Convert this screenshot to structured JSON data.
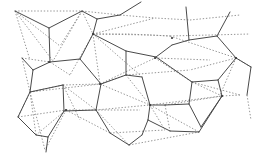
{
  "diagram": {
    "type": "voronoi-delaunay-overlay",
    "colors": {
      "background": "#ffffff",
      "voronoi": "#4a4a4a",
      "delaunay": "#8a8a8a",
      "site": "#3a3a3a"
    },
    "voronoi_edges": [
      [
        15,
        11,
        49,
        28
      ],
      [
        49,
        28,
        82,
        11
      ],
      [
        49,
        28,
        50,
        62
      ],
      [
        50,
        62,
        80,
        59
      ],
      [
        80,
        59,
        93,
        34
      ],
      [
        93,
        34,
        97,
        19
      ],
      [
        97,
        19,
        82,
        11
      ],
      [
        97,
        19,
        120,
        15
      ],
      [
        120,
        15,
        141,
        2
      ],
      [
        93,
        34,
        126,
        51
      ],
      [
        126,
        51,
        126,
        75
      ],
      [
        126,
        51,
        156,
        57
      ],
      [
        50,
        62,
        33,
        70
      ],
      [
        33,
        70,
        22,
        58
      ],
      [
        33,
        70,
        30,
        92
      ],
      [
        30,
        92,
        18,
        117
      ],
      [
        18,
        117,
        36,
        135
      ],
      [
        36,
        135,
        48,
        137
      ],
      [
        48,
        137,
        46,
        152
      ],
      [
        30,
        92,
        63,
        85
      ],
      [
        63,
        85,
        64,
        111
      ],
      [
        64,
        111,
        48,
        137
      ],
      [
        80,
        59,
        101,
        84
      ],
      [
        101,
        84,
        96,
        110
      ],
      [
        96,
        110,
        64,
        111
      ],
      [
        101,
        84,
        126,
        75
      ],
      [
        126,
        75,
        142,
        77
      ],
      [
        96,
        110,
        110,
        133
      ],
      [
        110,
        133,
        129,
        145
      ],
      [
        129,
        145,
        142,
        135
      ],
      [
        156,
        57,
        192,
        82
      ],
      [
        192,
        82,
        189,
        104
      ],
      [
        156,
        57,
        172,
        45
      ],
      [
        172,
        45,
        189,
        40
      ],
      [
        189,
        40,
        186,
        7
      ],
      [
        189,
        40,
        217,
        36
      ],
      [
        217,
        36,
        230,
        12
      ],
      [
        217,
        36,
        236,
        58
      ],
      [
        236,
        58,
        251,
        67
      ],
      [
        236,
        58,
        218,
        80
      ],
      [
        218,
        80,
        192,
        82
      ],
      [
        218,
        80,
        222,
        96
      ],
      [
        222,
        96,
        199,
        132
      ],
      [
        199,
        132,
        170,
        131
      ],
      [
        170,
        131,
        148,
        120
      ],
      [
        148,
        120,
        150,
        105
      ],
      [
        150,
        105,
        142,
        77
      ],
      [
        150,
        105,
        165,
        105
      ],
      [
        165,
        105,
        189,
        104
      ],
      [
        189,
        104,
        201,
        127
      ],
      [
        201,
        127,
        222,
        96
      ],
      [
        142,
        135,
        148,
        120
      ],
      [
        251,
        67,
        247,
        95
      ]
    ],
    "delaunay_edges": [
      [
        15,
        11,
        82,
        11
      ],
      [
        82,
        11,
        120,
        15
      ],
      [
        120,
        15,
        155,
        18
      ],
      [
        15,
        11,
        30,
        60
      ],
      [
        15,
        11,
        53,
        61
      ],
      [
        82,
        11,
        53,
        61
      ],
      [
        82,
        11,
        93,
        34
      ],
      [
        82,
        11,
        60,
        46
      ],
      [
        15,
        11,
        60,
        46
      ],
      [
        93,
        34,
        155,
        18
      ],
      [
        93,
        34,
        128,
        34
      ],
      [
        128,
        34,
        170,
        36
      ],
      [
        93,
        34,
        150,
        35
      ],
      [
        155,
        18,
        190,
        20
      ],
      [
        190,
        20,
        240,
        15
      ],
      [
        93,
        34,
        70,
        75
      ],
      [
        93,
        34,
        100,
        84
      ],
      [
        93,
        34,
        140,
        75
      ],
      [
        170,
        36,
        236,
        58
      ],
      [
        170,
        36,
        250,
        34
      ],
      [
        150,
        35,
        170,
        36
      ],
      [
        236,
        58,
        251,
        67
      ],
      [
        236,
        58,
        220,
        95
      ],
      [
        236,
        58,
        190,
        70
      ],
      [
        22,
        58,
        50,
        62
      ],
      [
        22,
        58,
        30,
        92
      ],
      [
        50,
        62,
        70,
        75
      ],
      [
        30,
        92,
        100,
        84
      ],
      [
        30,
        92,
        63,
        85
      ],
      [
        30,
        92,
        18,
        117
      ],
      [
        30,
        92,
        36,
        135
      ],
      [
        30,
        92,
        45,
        150
      ],
      [
        63,
        85,
        80,
        120
      ],
      [
        63,
        85,
        100,
        84
      ],
      [
        63,
        85,
        96,
        110
      ],
      [
        100,
        84,
        155,
        58
      ],
      [
        100,
        84,
        126,
        75
      ],
      [
        100,
        84,
        150,
        105
      ],
      [
        126,
        75,
        190,
        70
      ],
      [
        126,
        75,
        150,
        105
      ],
      [
        155,
        58,
        192,
        82
      ],
      [
        155,
        58,
        210,
        60
      ],
      [
        150,
        105,
        222,
        96
      ],
      [
        150,
        105,
        199,
        132
      ],
      [
        150,
        105,
        165,
        130
      ],
      [
        192,
        82,
        240,
        95
      ],
      [
        192,
        82,
        222,
        96
      ],
      [
        66,
        110,
        110,
        133
      ],
      [
        66,
        110,
        45,
        150
      ],
      [
        66,
        110,
        140,
        110
      ],
      [
        96,
        110,
        150,
        105
      ],
      [
        96,
        110,
        129,
        145
      ],
      [
        110,
        133,
        165,
        130
      ],
      [
        129,
        145,
        199,
        132
      ],
      [
        165,
        105,
        222,
        96
      ],
      [
        165,
        105,
        170,
        131
      ],
      [
        18,
        117,
        66,
        110
      ],
      [
        36,
        135,
        66,
        110
      ],
      [
        247,
        95,
        251,
        120
      ],
      [
        240,
        95,
        222,
        96
      ]
    ],
    "sites": [
      [
        49,
        62
      ],
      [
        93,
        34
      ],
      [
        66,
        110
      ],
      [
        100,
        84
      ],
      [
        150,
        105
      ],
      [
        155,
        58
      ],
      [
        172,
        38
      ],
      [
        222,
        96
      ],
      [
        236,
        58
      ]
    ]
  }
}
